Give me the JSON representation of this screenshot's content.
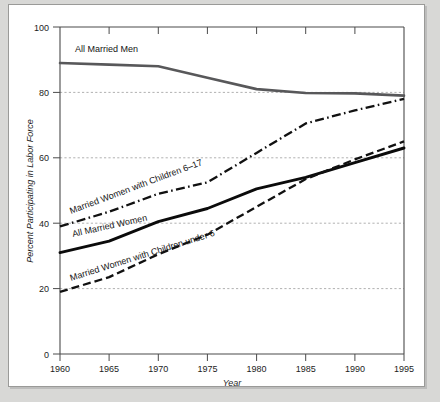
{
  "chart_data": {
    "type": "line",
    "title": "",
    "xlabel": "Year",
    "ylabel": "Percent Participating in Labor Force",
    "xlim": [
      1960,
      1995
    ],
    "ylim": [
      0,
      100
    ],
    "xticks": [
      1960,
      1965,
      1970,
      1975,
      1980,
      1985,
      1990,
      1995
    ],
    "yticks": [
      0,
      20,
      40,
      60,
      80,
      100
    ],
    "gridlines": [
      20,
      40,
      60,
      80
    ],
    "grid": true,
    "legend_position": "inline-labels",
    "x": [
      1960,
      1965,
      1970,
      1975,
      1980,
      1985,
      1990,
      1995
    ],
    "series": [
      {
        "name": "All Married Men",
        "style": "solid-gray",
        "color": "#58585a",
        "values": [
          89.0,
          88.5,
          88.0,
          84.5,
          81.0,
          79.8,
          79.7,
          79.0
        ]
      },
      {
        "name": "Married Women with Children 6–17",
        "style": "dash-dot",
        "color": "#111111",
        "values": [
          39.0,
          43.5,
          49.0,
          52.5,
          61.5,
          70.5,
          74.5,
          78.0
        ]
      },
      {
        "name": "All Married Women",
        "style": "solid-black",
        "color": "#0b0b0b",
        "values": [
          31.0,
          34.5,
          40.5,
          44.5,
          50.5,
          54.0,
          58.5,
          63.0
        ]
      },
      {
        "name": "Married Women with Children under 6",
        "style": "dashed",
        "color": "#111111",
        "values": [
          19.0,
          23.5,
          30.5,
          36.5,
          45.0,
          53.5,
          59.5,
          65.0
        ]
      }
    ]
  },
  "axes": {
    "x_tick_labels": [
      "1960",
      "1965",
      "1970",
      "1975",
      "1980",
      "1985",
      "1990",
      "1995"
    ],
    "y_tick_labels": [
      "0",
      "20",
      "40",
      "60",
      "80",
      "100"
    ],
    "x_title": "Year",
    "y_title": "Percent Participating in Labor Force"
  },
  "annotations": {
    "men_label": "All Married Men",
    "six17_label": "Married Women with Children 6–17",
    "allwomen_label": "All Married Women",
    "under6_label": "Married Women with Children under 6"
  },
  "colors": {
    "page_background": "#d8d8d6",
    "panel_background": "#ffffff",
    "panel_border": "#9a9a98",
    "axis": "#4a4a4a",
    "grid": "#8f8f8f",
    "men_series": "#58585a",
    "women_series": "#0b0b0b"
  }
}
